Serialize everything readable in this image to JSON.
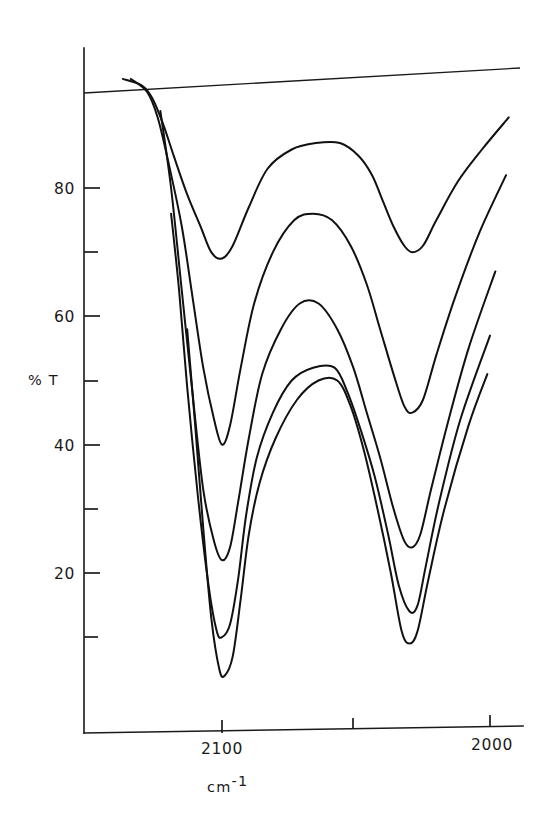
{
  "chart_data": {
    "type": "line",
    "title": "",
    "subtitle": "",
    "xlabel": "cm-1",
    "xlabel_base": "cm",
    "xlabel_exponent": "-1",
    "ylabel": "% T",
    "xlim": [
      2140,
      1985
    ],
    "ylim": [
      0,
      100
    ],
    "x_reversed": true,
    "grid": false,
    "legend": false,
    "legend_position": "none",
    "x_ticks_major": [
      2100,
      2000
    ],
    "x_ticks_major_labels": [
      "2100",
      "2000"
    ],
    "x_ticks_minor": [
      2050
    ],
    "y_ticks_major": [
      80,
      60,
      40,
      20
    ],
    "y_ticks_major_labels": [
      "80",
      "60",
      "40",
      "20"
    ],
    "y_ticks_minor": [
      90,
      70,
      50,
      30,
      10
    ],
    "baseline_value": 100,
    "units": {
      "x": "cm-1",
      "y": "percent transmittance"
    },
    "series": [
      {
        "name": "trace-1",
        "min_transmittance": [
          {
            "x": 2100,
            "y": 69
          },
          {
            "x": 2030,
            "y": 70
          }
        ],
        "points": [
          {
            "x": 2137,
            "y": 97
          },
          {
            "x": 2130,
            "y": 96
          },
          {
            "x": 2126,
            "y": 94
          },
          {
            "x": 2122,
            "y": 90
          },
          {
            "x": 2118,
            "y": 85
          },
          {
            "x": 2113,
            "y": 79
          },
          {
            "x": 2108,
            "y": 74
          },
          {
            "x": 2104,
            "y": 70
          },
          {
            "x": 2100,
            "y": 69
          },
          {
            "x": 2096,
            "y": 71
          },
          {
            "x": 2090,
            "y": 77
          },
          {
            "x": 2083,
            "y": 83
          },
          {
            "x": 2074,
            "y": 86
          },
          {
            "x": 2065,
            "y": 87
          },
          {
            "x": 2056,
            "y": 87
          },
          {
            "x": 2049,
            "y": 85
          },
          {
            "x": 2044,
            "y": 82
          },
          {
            "x": 2040,
            "y": 78
          },
          {
            "x": 2036,
            "y": 74
          },
          {
            "x": 2032,
            "y": 71
          },
          {
            "x": 2029,
            "y": 70
          },
          {
            "x": 2025,
            "y": 71
          },
          {
            "x": 2020,
            "y": 75
          },
          {
            "x": 2012,
            "y": 81
          },
          {
            "x": 2003,
            "y": 86
          },
          {
            "x": 1993,
            "y": 91
          }
        ]
      },
      {
        "name": "trace-2",
        "min_transmittance": [
          {
            "x": 2100,
            "y": 40
          },
          {
            "x": 2030,
            "y": 45
          }
        ],
        "points": [
          {
            "x": 2134,
            "y": 97
          },
          {
            "x": 2128,
            "y": 95
          },
          {
            "x": 2124,
            "y": 91
          },
          {
            "x": 2120,
            "y": 84
          },
          {
            "x": 2115,
            "y": 74
          },
          {
            "x": 2111,
            "y": 63
          },
          {
            "x": 2107,
            "y": 52
          },
          {
            "x": 2103,
            "y": 44
          },
          {
            "x": 2100,
            "y": 40
          },
          {
            "x": 2097,
            "y": 43
          },
          {
            "x": 2093,
            "y": 52
          },
          {
            "x": 2088,
            "y": 62
          },
          {
            "x": 2081,
            "y": 70
          },
          {
            "x": 2073,
            "y": 75
          },
          {
            "x": 2066,
            "y": 76
          },
          {
            "x": 2059,
            "y": 75
          },
          {
            "x": 2052,
            "y": 71
          },
          {
            "x": 2046,
            "y": 65
          },
          {
            "x": 2041,
            "y": 58
          },
          {
            "x": 2036,
            "y": 51
          },
          {
            "x": 2032,
            "y": 46
          },
          {
            "x": 2029,
            "y": 45
          },
          {
            "x": 2025,
            "y": 47
          },
          {
            "x": 2020,
            "y": 54
          },
          {
            "x": 2013,
            "y": 63
          },
          {
            "x": 2004,
            "y": 73
          },
          {
            "x": 1994,
            "y": 82
          }
        ]
      },
      {
        "name": "trace-3",
        "min_transmittance": [
          {
            "x": 2100,
            "y": 22
          },
          {
            "x": 2030,
            "y": 24
          }
        ],
        "points": [
          {
            "x": 2123,
            "y": 92
          },
          {
            "x": 2119,
            "y": 80
          },
          {
            "x": 2115,
            "y": 64
          },
          {
            "x": 2111,
            "y": 48
          },
          {
            "x": 2107,
            "y": 33
          },
          {
            "x": 2103,
            "y": 25
          },
          {
            "x": 2100,
            "y": 22
          },
          {
            "x": 2097,
            "y": 24
          },
          {
            "x": 2094,
            "y": 31
          },
          {
            "x": 2090,
            "y": 41
          },
          {
            "x": 2085,
            "y": 51
          },
          {
            "x": 2078,
            "y": 58
          },
          {
            "x": 2071,
            "y": 62
          },
          {
            "x": 2064,
            "y": 62
          },
          {
            "x": 2057,
            "y": 58
          },
          {
            "x": 2051,
            "y": 52
          },
          {
            "x": 2046,
            "y": 45
          },
          {
            "x": 2041,
            "y": 38
          },
          {
            "x": 2036,
            "y": 30
          },
          {
            "x": 2032,
            "y": 25
          },
          {
            "x": 2029,
            "y": 24
          },
          {
            "x": 2026,
            "y": 26
          },
          {
            "x": 2022,
            "y": 33
          },
          {
            "x": 2016,
            "y": 43
          },
          {
            "x": 2008,
            "y": 55
          },
          {
            "x": 1998,
            "y": 67
          }
        ]
      },
      {
        "name": "trace-4",
        "min_transmittance": [
          {
            "x": 2100,
            "y": 10
          },
          {
            "x": 2030,
            "y": 14
          }
        ],
        "points": [
          {
            "x": 2119,
            "y": 76
          },
          {
            "x": 2116,
            "y": 64
          },
          {
            "x": 2113,
            "y": 49
          },
          {
            "x": 2109,
            "y": 32
          },
          {
            "x": 2105,
            "y": 18
          },
          {
            "x": 2102,
            "y": 11
          },
          {
            "x": 2100,
            "y": 10
          },
          {
            "x": 2097,
            "y": 12
          },
          {
            "x": 2094,
            "y": 19
          },
          {
            "x": 2091,
            "y": 29
          },
          {
            "x": 2087,
            "y": 38
          },
          {
            "x": 2081,
            "y": 45
          },
          {
            "x": 2074,
            "y": 50
          },
          {
            "x": 2066,
            "y": 52
          },
          {
            "x": 2058,
            "y": 52
          },
          {
            "x": 2053,
            "y": 48
          },
          {
            "x": 2048,
            "y": 42
          },
          {
            "x": 2043,
            "y": 35
          },
          {
            "x": 2038,
            "y": 26
          },
          {
            "x": 2034,
            "y": 18
          },
          {
            "x": 2030,
            "y": 14
          },
          {
            "x": 2027,
            "y": 15
          },
          {
            "x": 2024,
            "y": 21
          },
          {
            "x": 2019,
            "y": 31
          },
          {
            "x": 2011,
            "y": 44
          },
          {
            "x": 2000,
            "y": 57
          }
        ]
      },
      {
        "name": "trace-5",
        "min_transmittance": [
          {
            "x": 2100,
            "y": 4
          },
          {
            "x": 2030,
            "y": 9
          }
        ],
        "points": [
          {
            "x": 2113,
            "y": 58
          },
          {
            "x": 2110,
            "y": 43
          },
          {
            "x": 2107,
            "y": 27
          },
          {
            "x": 2104,
            "y": 13
          },
          {
            "x": 2101,
            "y": 5
          },
          {
            "x": 2099,
            "y": 4
          },
          {
            "x": 2096,
            "y": 7
          },
          {
            "x": 2093,
            "y": 16
          },
          {
            "x": 2090,
            "y": 26
          },
          {
            "x": 2086,
            "y": 34
          },
          {
            "x": 2080,
            "y": 41
          },
          {
            "x": 2072,
            "y": 47
          },
          {
            "x": 2064,
            "y": 50
          },
          {
            "x": 2057,
            "y": 50
          },
          {
            "x": 2052,
            "y": 46
          },
          {
            "x": 2047,
            "y": 39
          },
          {
            "x": 2042,
            "y": 30
          },
          {
            "x": 2037,
            "y": 20
          },
          {
            "x": 2033,
            "y": 11
          },
          {
            "x": 2030,
            "y": 9
          },
          {
            "x": 2027,
            "y": 11
          },
          {
            "x": 2023,
            "y": 19
          },
          {
            "x": 2017,
            "y": 30
          },
          {
            "x": 2008,
            "y": 43
          },
          {
            "x": 2001,
            "y": 51
          }
        ]
      }
    ]
  }
}
